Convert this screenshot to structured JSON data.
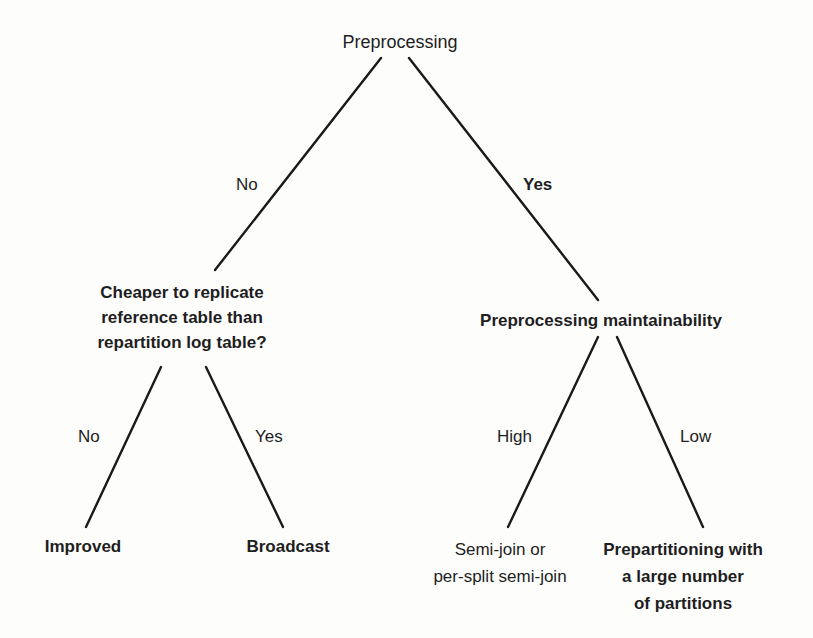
{
  "diagram": {
    "type": "decision-tree",
    "root": {
      "label": "Preprocessing",
      "branches": {
        "left_label": "No",
        "right_label": "Yes"
      }
    },
    "left_node": {
      "label": "Cheaper to replicate\nreference table than\nrepartition log table?",
      "branches": {
        "left_label": "No",
        "right_label": "Yes"
      },
      "leaves": {
        "left": "Improved",
        "right": "Broadcast"
      }
    },
    "right_node": {
      "label": "Preprocessing maintainability",
      "branches": {
        "left_label": "High",
        "right_label": "Low"
      },
      "leaves": {
        "left": "Semi-join or\nper-split semi-join",
        "right": "Prepartitioning with\na large number\nof partitions"
      }
    },
    "colors": {
      "background": "#fdfdfc",
      "line": "#1a1a1a",
      "text": "#1e1e1e"
    }
  }
}
